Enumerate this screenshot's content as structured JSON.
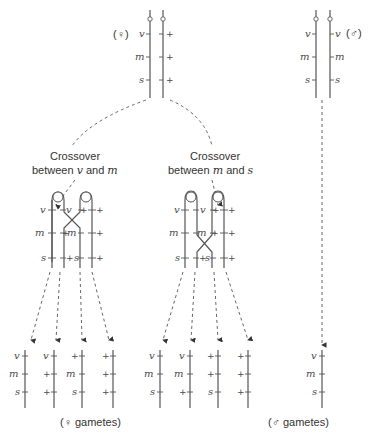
{
  "labels": {
    "female_symbol": "(♀)",
    "male_symbol": "(♂)",
    "crossover_vm_line1": "Crossover",
    "crossover_vm_line2": "between",
    "crossover_vm_gene1": "v",
    "crossover_vm_and": "and",
    "crossover_vm_gene2": "m",
    "crossover_ms_line1": "Crossover",
    "crossover_ms_line2": "between",
    "crossover_ms_gene1": "m",
    "crossover_ms_and": "and",
    "crossover_ms_gene2": "s",
    "female_gametes": "(♀ gametes)",
    "male_gametes": "(♂ gametes)"
  },
  "female_parent": {
    "chromosome_1": [
      "v",
      "m",
      "s"
    ],
    "chromosome_2": [
      "+",
      "+",
      "+"
    ]
  },
  "male_parent": {
    "chromosome_1": [
      "v",
      "m",
      "s"
    ],
    "chromosome_2": [
      "v",
      "m",
      "s"
    ]
  },
  "crossover_vm": {
    "chromatids_left_labels": [
      "v",
      "m",
      "s"
    ],
    "chromatid_inner_labels": [
      [
        "v",
        "+m",
        "s"
      ],
      [
        "+",
        "m",
        "+"
      ]
    ],
    "gametes": [
      [
        "v",
        "m",
        "s"
      ],
      [
        "v",
        "+",
        "+"
      ],
      [
        "+",
        "m",
        "s"
      ],
      [
        "+",
        "+",
        "+"
      ]
    ]
  },
  "crossover_ms": {
    "gametes": [
      [
        "v",
        "m",
        "s"
      ],
      [
        "v",
        "m",
        "+"
      ],
      [
        "+",
        "+",
        "s"
      ],
      [
        "+",
        "+",
        "+"
      ]
    ]
  },
  "male_gamete": [
    "v",
    "m",
    "s"
  ]
}
